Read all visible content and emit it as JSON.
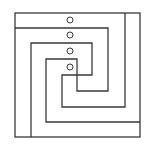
{
  "figure": {
    "stroke_color": "#3a3a3a",
    "background": "#ffffff",
    "outer_box": {
      "x": 15,
      "y": 13,
      "width": 125,
      "height": 124
    },
    "paths": [
      {
        "name": "spiral-a",
        "points": [
          [
            125,
            13
          ],
          [
            125,
            107
          ],
          [
            62,
            107
          ],
          [
            62,
            75
          ],
          [
            92,
            75
          ],
          [
            92,
            43
          ],
          [
            31,
            43
          ],
          [
            31,
            137
          ]
        ]
      },
      {
        "name": "spiral-b",
        "points": [
          [
            15,
            28
          ],
          [
            108,
            28
          ],
          [
            108,
            91
          ],
          [
            77,
            91
          ],
          [
            77,
            59
          ],
          [
            46,
            59
          ],
          [
            46,
            122
          ],
          [
            140,
            122
          ]
        ]
      }
    ],
    "markers": [
      {
        "cx": 70,
        "cy": 20,
        "r": 3
      },
      {
        "cx": 70,
        "cy": 35,
        "r": 3
      },
      {
        "cx": 70,
        "cy": 51,
        "r": 3
      },
      {
        "cx": 70,
        "cy": 67,
        "r": 3
      }
    ]
  }
}
